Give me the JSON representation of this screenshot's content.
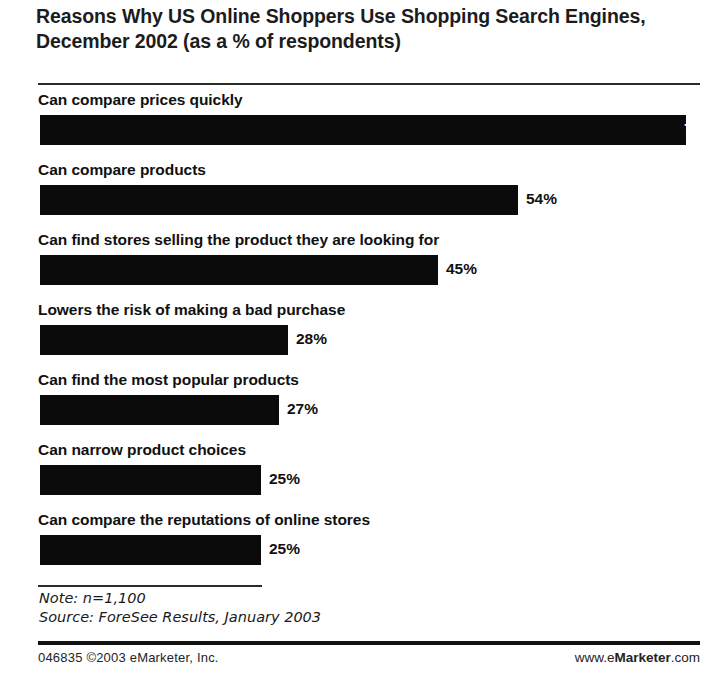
{
  "chart_data": {
    "type": "bar",
    "orientation": "horizontal",
    "title": "Reasons Why US Online Shoppers Use Shopping Search Engines, December 2002 (as a % of respondents)",
    "xlabel": "",
    "ylabel": "",
    "unit": "%",
    "xlim": [
      0,
      73
    ],
    "grid": false,
    "legend": "none",
    "categories": [
      "Can compare prices quickly",
      "Can compare products",
      "Can find stores selling the product they are looking for",
      "Lowers the risk of making a bad purchase",
      "Can find the most popular products",
      "Can narrow product choices",
      "Can compare the reputations of online stores"
    ],
    "values": [
      73,
      54,
      45,
      28,
      27,
      25,
      25
    ],
    "value_labels": [
      "73%",
      "54%",
      "45%",
      "28%",
      "27%",
      "25%",
      "25%"
    ],
    "label_placement": [
      "inside",
      "outside",
      "outside",
      "outside",
      "outside",
      "outside",
      "outside"
    ],
    "bar_color": "#0b0b0b",
    "background_color": "#ffffff"
  },
  "rows": [
    {
      "label": "Can compare prices quickly",
      "value": 73,
      "value_label": "73%",
      "inside": true
    },
    {
      "label": "Can compare products",
      "value": 54,
      "value_label": "54%",
      "inside": false
    },
    {
      "label": "Can find stores selling the product they are looking for",
      "value": 45,
      "value_label": "45%",
      "inside": false
    },
    {
      "label": "Lowers the risk of making a bad purchase",
      "value": 28,
      "value_label": "28%",
      "inside": false
    },
    {
      "label": "Can find the most popular products",
      "value": 27,
      "value_label": "27%",
      "inside": false
    },
    {
      "label": "Can narrow product choices",
      "value": 25,
      "value_label": "25%",
      "inside": false
    },
    {
      "label": "Can compare the reputations of online stores",
      "value": 25,
      "value_label": "25%",
      "inside": false
    }
  ],
  "notes": {
    "note": "Note: n=1,100",
    "source": "Source: ForeSee Results, January 2003"
  },
  "footer": {
    "left": "046835 ©2003 eMarketer, Inc.",
    "right_prefix": "www.e",
    "right_brand": "Marketer",
    "right_suffix": ".com"
  }
}
